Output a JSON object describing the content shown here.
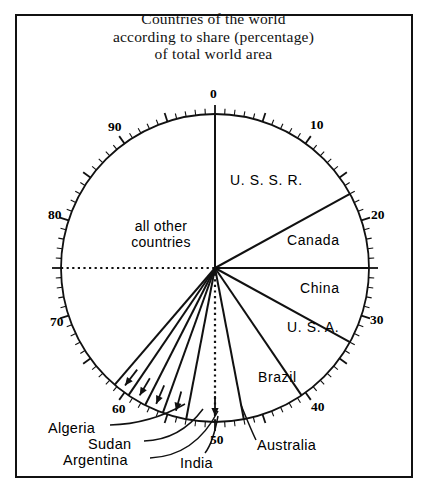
{
  "title": {
    "line1": "Countries of the world",
    "line2": "according to share (percentage)",
    "line3": "of total world area"
  },
  "axis": {
    "tick_labels": [
      {
        "value": "0",
        "pct": 0
      },
      {
        "value": "10",
        "pct": 10
      },
      {
        "value": "20",
        "pct": 20
      },
      {
        "value": "30",
        "pct": 30
      },
      {
        "value": "40",
        "pct": 40
      },
      {
        "value": "50",
        "pct": 50
      },
      {
        "value": "60",
        "pct": 60
      },
      {
        "value": "70",
        "pct": 70
      },
      {
        "value": "80",
        "pct": 80
      },
      {
        "value": "90",
        "pct": 90
      }
    ],
    "minor_tick_step": 1,
    "major_tick_step": 5,
    "units": "percent of total world area"
  },
  "labels": {
    "ussr": "U. S. S. R.",
    "canada": "Canada",
    "china": "China",
    "usa": "U. S. A.",
    "brazil": "Brazil",
    "australia": "Australia",
    "india": "India",
    "argentina": "Argentina",
    "sudan": "Sudan",
    "algeria": "Algeria",
    "all_other": "all other\ncountries",
    "all_other_l1": "all other",
    "all_other_l2": "countries"
  },
  "colors": {
    "ink": "#111111",
    "background": "#ffffff"
  },
  "chart_data": {
    "type": "pie",
    "title": "Countries of the world according to share (percentage) of total world area",
    "units": "percent of total world area",
    "start_angle_deg": 0,
    "direction": "clockwise",
    "axis_range": [
      0,
      100
    ],
    "grid": false,
    "legend": "none",
    "labels": [
      "U. S. S. R.",
      "Canada",
      "China",
      "U. S. A.",
      "Brazil",
      "Australia",
      "India",
      "Argentina",
      "Sudan",
      "Algeria",
      "all other countries"
    ],
    "values": [
      17.0,
      8.0,
      8.0,
      7.5,
      6.5,
      6.0,
      2.5,
      2.0,
      2.0,
      1.8,
      38.7
    ],
    "slices": [
      {
        "name": "U. S. S. R.",
        "value": 17.0,
        "start_pct": 0.0,
        "end_pct": 17.0
      },
      {
        "name": "Canada",
        "value": 8.0,
        "start_pct": 17.0,
        "end_pct": 25.0
      },
      {
        "name": "China",
        "value": 8.0,
        "start_pct": 25.0,
        "end_pct": 33.0
      },
      {
        "name": "U. S. A.",
        "value": 7.5,
        "start_pct": 33.0,
        "end_pct": 40.5
      },
      {
        "name": "Brazil",
        "value": 6.5,
        "start_pct": 40.5,
        "end_pct": 47.0
      },
      {
        "name": "Australia",
        "value": 6.0,
        "start_pct": 47.0,
        "end_pct": 53.0
      },
      {
        "name": "India",
        "value": 2.5,
        "start_pct": 53.0,
        "end_pct": 55.5
      },
      {
        "name": "Argentina",
        "value": 2.0,
        "start_pct": 55.5,
        "end_pct": 57.5
      },
      {
        "name": "Sudan",
        "value": 2.0,
        "start_pct": 57.5,
        "end_pct": 59.5
      },
      {
        "name": "Algeria",
        "value": 1.8,
        "start_pct": 59.5,
        "end_pct": 61.3
      },
      {
        "name": "all other countries",
        "value": 38.7,
        "start_pct": 61.3,
        "end_pct": 100.0
      }
    ]
  }
}
